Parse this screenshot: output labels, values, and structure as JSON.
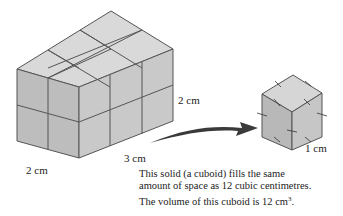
{
  "diagram": {
    "type": "isometric-volume-illustration",
    "large_cuboid": {
      "name": "cuboid",
      "dimensions": {
        "height": "2 cm",
        "width": "2 cm",
        "length": "3 cm"
      },
      "unit_cubes": 12,
      "colors": {
        "top": "#d9d9d9",
        "left": "#bdbdbd",
        "right": "#c9c9c9",
        "edge": "#555555"
      }
    },
    "unit_cube": {
      "label": "1 cm",
      "colors": {
        "top": "#d6d6d6",
        "left": "#b8b8b8",
        "right": "#c6c6c6",
        "edge": "#555555"
      }
    },
    "arrow": {
      "color": "#3a3a3a",
      "from": "cuboid",
      "to": "unit-cube"
    }
  },
  "labels": {
    "height": "2 cm",
    "width": "2 cm",
    "length": "3 cm",
    "unit": "1 cm"
  },
  "caption": {
    "line1a": "This solid (a cuboid) fills the same",
    "line1b": "amount of space as 12 cubic centimetres.",
    "line2_prefix": "The volume of this cuboid is 12 cm",
    "line2_sup": "3",
    "line2_suffix": "."
  }
}
